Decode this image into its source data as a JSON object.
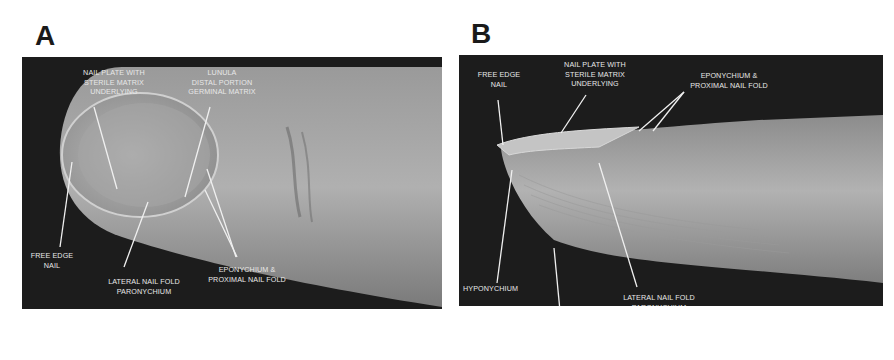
{
  "figure": {
    "panels": [
      {
        "letter": "A",
        "view": "dorsal",
        "labels": {
          "nail_plate": [
            "NAIL PLATE WITH",
            "STERILE MATRIX",
            "UNDERLYING"
          ],
          "lunula": [
            "LUNULA",
            "DISTAL PORTION",
            "GERMINAL MATRIX"
          ],
          "free_edge": [
            "FREE EDGE",
            "NAIL"
          ],
          "lateral_fold": [
            "LATERAL NAIL FOLD",
            "PARONYCHIUM"
          ],
          "eponychium": [
            "EPONYCHIUM &",
            "PROXIMAL NAIL FOLD"
          ]
        }
      },
      {
        "letter": "B",
        "view": "lateral",
        "labels": {
          "free_edge": [
            "FREE EDGE",
            "NAIL"
          ],
          "nail_plate": [
            "NAIL PLATE WITH",
            "STERILE MATRIX",
            "UNDERLYING"
          ],
          "eponychium": [
            "EPONYCHIUM &",
            "PROXIMAL NAIL FOLD"
          ],
          "hyponychium": [
            "HYPONYCHIUM"
          ],
          "volar_pad": [
            "VOLAR PAD"
          ],
          "lateral_fold": [
            "LATERAL NAIL FOLD",
            "PARONYCHIUM"
          ]
        }
      }
    ],
    "colors": {
      "background": "#1c1c1c",
      "skin": "#a9a9a9",
      "label": "#e8e8e8"
    }
  }
}
